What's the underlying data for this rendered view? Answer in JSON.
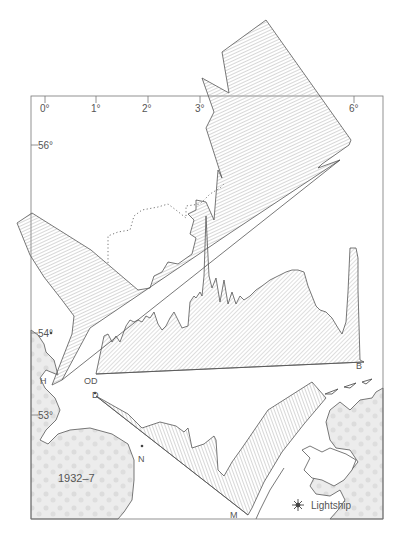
{
  "figure": {
    "period_label": "1932–7",
    "legend": {
      "icon": "lightship-icon",
      "label": "Lightship"
    },
    "longitude_ticks": [
      {
        "label": "0°",
        "x": 46
      },
      {
        "label": "1°",
        "x": 97
      },
      {
        "label": "2°",
        "x": 148
      },
      {
        "label": "3°",
        "x": 201
      },
      {
        "label": "6°",
        "x": 355
      }
    ],
    "latitude_ticks": [
      {
        "label": "56°",
        "y": 145
      },
      {
        "label": "54°",
        "y": 333
      },
      {
        "label": "53°",
        "y": 415
      }
    ],
    "station_labels": [
      {
        "label": "H",
        "x": 40,
        "y": 384
      },
      {
        "label": "OD",
        "x": 84,
        "y": 384
      },
      {
        "label": "D",
        "x": 92,
        "y": 398
      },
      {
        "label": "N",
        "x": 138,
        "y": 462
      },
      {
        "label": "M",
        "x": 230,
        "y": 518
      },
      {
        "label": "B",
        "x": 356,
        "y": 369
      }
    ],
    "caption_fragment": ""
  },
  "colors": {
    "line": "#555555",
    "hatch": "#8a8a8a",
    "land": "#e6e6e6",
    "frame": "#777777",
    "text": "#555555"
  }
}
